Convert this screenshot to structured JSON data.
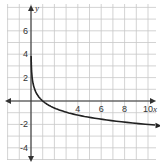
{
  "chart_data": {
    "type": "line",
    "title": "",
    "xlabel": "x",
    "ylabel": "y",
    "xlim": [
      -2,
      10.8
    ],
    "ylim": [
      -5.2,
      7.8
    ],
    "grid": true,
    "x_ticks": [
      4,
      6,
      8,
      10
    ],
    "y_ticks": [
      6,
      4,
      2,
      -2,
      -4
    ],
    "x_tick_labels": [
      "4",
      "6",
      "8",
      "10"
    ],
    "y_tick_labels": [
      "6",
      "4",
      "2",
      "-2",
      "-4"
    ],
    "series": [
      {
        "name": "curve",
        "description": "decreasing logarithmic curve, vertical asymptote at x=0, passes through (1,0)",
        "x": [
          0.01,
          0.05,
          0.1,
          0.25,
          0.5,
          1,
          2,
          3,
          4,
          5,
          6,
          7,
          8,
          9,
          10,
          10.6
        ],
        "y": [
          4.0,
          2.6,
          2.0,
          1.2,
          0.6,
          0,
          -0.6,
          -0.95,
          -1.2,
          -1.4,
          -1.56,
          -1.69,
          -1.81,
          -1.91,
          -2.0,
          -2.05
        ]
      }
    ],
    "legend": []
  },
  "labels": {
    "x_axis": "x",
    "y_axis": "y",
    "x_ticks": [
      "4",
      "6",
      "8",
      "10"
    ],
    "y_ticks": [
      "6",
      "4",
      "2",
      "-2",
      "-4"
    ]
  }
}
